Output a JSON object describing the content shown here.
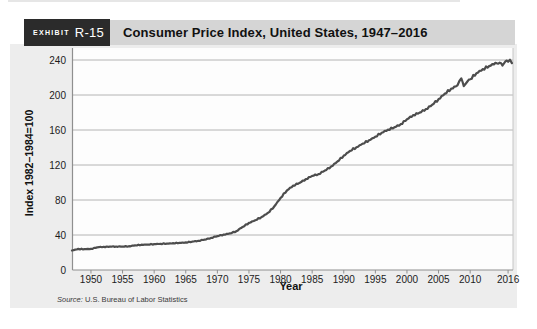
{
  "exhibit": {
    "label": "EXHIBIT",
    "number": "R-15"
  },
  "header": {
    "title": "Consumer Price Index, United States, 1947–2016"
  },
  "chart_data": {
    "type": "line",
    "title": "Consumer Price Index, United States, 1947–2016",
    "xlabel": "Year",
    "ylabel": "Index 1982–1984=100",
    "xlim": [
      1947,
      2016.7
    ],
    "ylim": [
      0,
      240
    ],
    "xticks": [
      1950,
      1955,
      1960,
      1965,
      1970,
      1975,
      1980,
      1985,
      1990,
      1995,
      2000,
      2005,
      2010,
      2016
    ],
    "yticks": [
      0,
      40,
      80,
      120,
      160,
      200,
      240
    ],
    "grid": "horizontal",
    "legend": "none",
    "series": [
      {
        "name": "CPI, United States (Index 1982–1984=100)",
        "x": [
          1947,
          1948,
          1949,
          1950,
          1951,
          1952,
          1953,
          1954,
          1955,
          1956,
          1957,
          1958,
          1959,
          1960,
          1961,
          1962,
          1963,
          1964,
          1965,
          1966,
          1967,
          1968,
          1969,
          1970,
          1971,
          1972,
          1973,
          1974,
          1975,
          1976,
          1977,
          1978,
          1979,
          1980,
          1981,
          1982,
          1983,
          1984,
          1985,
          1986,
          1987,
          1988,
          1989,
          1990,
          1991,
          1992,
          1993,
          1994,
          1995,
          1996,
          1997,
          1998,
          1999,
          2000,
          2001,
          2002,
          2003,
          2004,
          2005,
          2006,
          2007,
          2008,
          2008.6,
          2009,
          2009.6,
          2010,
          2011,
          2012,
          2013,
          2014,
          2014.9,
          2015.1,
          2015.6,
          2016,
          2016.3,
          2016.6
        ],
        "y": [
          22.3,
          24.1,
          23.8,
          24.1,
          26.0,
          26.5,
          26.7,
          26.9,
          26.8,
          27.2,
          28.1,
          28.9,
          29.1,
          29.6,
          29.9,
          30.2,
          30.6,
          31.0,
          31.5,
          32.4,
          33.4,
          34.8,
          36.7,
          38.8,
          40.5,
          41.8,
          44.4,
          49.3,
          53.8,
          56.9,
          60.6,
          65.2,
          72.6,
          82.4,
          90.9,
          96.5,
          99.6,
          103.9,
          107.6,
          109.6,
          113.6,
          118.3,
          124.0,
          130.7,
          136.2,
          140.3,
          144.5,
          148.2,
          152.4,
          156.9,
          160.5,
          163.0,
          166.6,
          172.2,
          177.1,
          179.9,
          184.0,
          188.9,
          195.3,
          201.6,
          207.3,
          211.1,
          219.1,
          210.2,
          215.7,
          218.1,
          224.9,
          229.6,
          233.0,
          236.7,
          236.2,
          233.7,
          238.6,
          238.0,
          240.3,
          236.5
        ]
      }
    ]
  },
  "source": {
    "prefix": "Source:",
    "text": "U.S. Bureau of Labor Statistics"
  },
  "colors": {
    "exhibit_box": "#2b2b2b",
    "header_bar": "#d5d5d5",
    "panel": "#ededed",
    "plot_bg": "#fdfdfd",
    "grid": "#b4b4b4",
    "axis": "#8f8f8f",
    "plot_right_border": "#c6c6c6",
    "line": "#4d4d4d",
    "tick_text": "#1c1c1c"
  }
}
